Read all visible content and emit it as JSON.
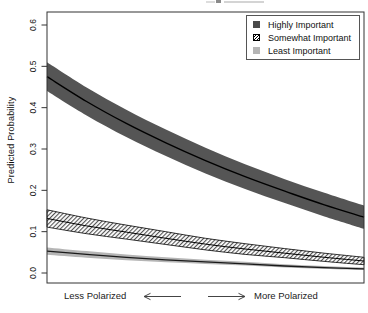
{
  "figure": {
    "y_axis_label": "Predicted Probability",
    "x_annotation": {
      "left_label": "Less Polarized",
      "right_label": "More Polarized"
    },
    "legend": {
      "position": "top-right",
      "items": [
        {
          "label": "Highly Important",
          "marker": "dark-gray-filled-square"
        },
        {
          "label": "Somewhat Important",
          "marker": "diagonal-hatched-square"
        },
        {
          "label": "Least Important",
          "marker": "light-gray-filled-square"
        }
      ]
    }
  },
  "colors": {
    "dark_band": "#555555",
    "center_line": "#000000",
    "light_band": "#b5b5b5",
    "light_band_line": "#1a1a1a",
    "frame": "#333333",
    "hatch_line": "#111111",
    "text": "#111111"
  },
  "chart_data": {
    "type": "line",
    "title": "",
    "ylabel": "Predicted Probability",
    "xlabel": "Less Polarized ←   → More Polarized",
    "ylim": [
      0.0,
      0.6
    ],
    "yticks": [
      0.0,
      0.1,
      0.2,
      0.3,
      0.4,
      0.5,
      0.6
    ],
    "ytick_labels": [
      "0.0",
      "0.1",
      "0.2",
      "0.3",
      "0.4",
      "0.5",
      "0.6"
    ],
    "x_axis": "polarization (no numeric ticks shown; arrows from Less Polarized to More Polarized)",
    "x_fraction": [
      0,
      0.125,
      0.25,
      0.375,
      0.5,
      0.625,
      0.75,
      0.875,
      1
    ],
    "legend_position": "top-right",
    "grid": false,
    "series": [
      {
        "name": "Highly Important",
        "band_style": "dark",
        "center": [
          0.475,
          0.415,
          0.362,
          0.315,
          0.272,
          0.233,
          0.198,
          0.165,
          0.135
        ],
        "upper": [
          0.51,
          0.449,
          0.395,
          0.347,
          0.303,
          0.263,
          0.227,
          0.194,
          0.163
        ],
        "lower": [
          0.44,
          0.381,
          0.329,
          0.283,
          0.241,
          0.203,
          0.169,
          0.137,
          0.107
        ]
      },
      {
        "name": "Somewhat Important",
        "band_style": "hatched",
        "center": [
          0.132,
          0.114,
          0.099,
          0.084,
          0.07,
          0.058,
          0.048,
          0.038,
          0.029
        ],
        "upper": [
          0.153,
          0.133,
          0.116,
          0.1,
          0.084,
          0.071,
          0.059,
          0.048,
          0.038
        ],
        "lower": [
          0.111,
          0.095,
          0.082,
          0.069,
          0.056,
          0.045,
          0.037,
          0.028,
          0.02
        ]
      },
      {
        "name": "Least Important",
        "band_style": "light",
        "center": [
          0.053,
          0.045,
          0.038,
          0.032,
          0.027,
          0.022,
          0.017,
          0.013,
          0.01
        ],
        "upper": [
          0.062,
          0.053,
          0.045,
          0.038,
          0.032,
          0.027,
          0.021,
          0.017,
          0.013
        ],
        "lower": [
          0.044,
          0.037,
          0.031,
          0.026,
          0.022,
          0.018,
          0.013,
          0.01,
          0.007
        ]
      }
    ]
  }
}
